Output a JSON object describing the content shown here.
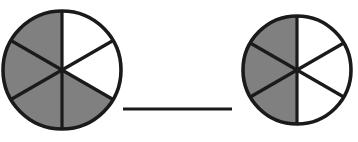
{
  "canvas": {
    "width": 358,
    "height": 142,
    "background_color": "#FFFFFF",
    "description": "Two fraction circles each divided into six equal sectors, separated by a horizontal bar"
  },
  "colors": {
    "shaded": "#808080",
    "unshaded": "#FFFFFF",
    "outline": "#1A1A1A",
    "divider": "#1A1A1A",
    "bar": "#1A1A1A"
  },
  "chart_data": {
    "type": "pie",
    "title": "",
    "xlabel": "",
    "ylabel": "",
    "legend_position": "none",
    "grid": false,
    "charts": [
      {
        "name": "left-fraction-circle",
        "center_x": 62,
        "center_y": 70,
        "radius": 59,
        "total_sectors": 6,
        "shaded_sectors": 4,
        "fraction_label": "4/6",
        "sector_angle_degrees": 60,
        "start_angle_degrees": -90,
        "categories": [
          "sector-1",
          "sector-2",
          "sector-3",
          "sector-4",
          "sector-5",
          "sector-6"
        ],
        "values": [
          1,
          1,
          1,
          1,
          1,
          1
        ],
        "sector_fills": [
          "#FFFFFF",
          "#FFFFFF",
          "#808080",
          "#808080",
          "#808080",
          "#808080"
        ]
      },
      {
        "name": "right-fraction-circle",
        "center_x": 297,
        "center_y": 70,
        "radius": 54,
        "total_sectors": 6,
        "shaded_sectors": 3,
        "fraction_label": "3/6",
        "sector_angle_degrees": 60,
        "start_angle_degrees": -90,
        "categories": [
          "sector-1",
          "sector-2",
          "sector-3",
          "sector-4",
          "sector-5",
          "sector-6"
        ],
        "values": [
          1,
          1,
          1,
          1,
          1,
          1
        ],
        "sector_fills": [
          "#FFFFFF",
          "#FFFFFF",
          "#FFFFFF",
          "#808080",
          "#808080",
          "#808080"
        ]
      }
    ]
  },
  "comparison_bar": {
    "label": "",
    "x_start": 123,
    "x_end": 232,
    "y": 109,
    "thickness": 3
  }
}
